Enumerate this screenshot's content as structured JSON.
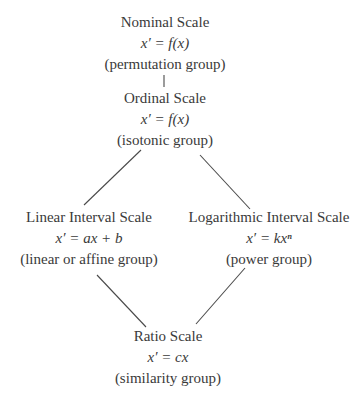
{
  "diagram": {
    "nodes": [
      {
        "id": "nominal",
        "title": "Nominal Scale",
        "formula": "x′ = f(x)",
        "group": "(permutation group)"
      },
      {
        "id": "ordinal",
        "title": "Ordinal Scale",
        "formula": "x′ = f(x)",
        "group": "(isotonic group)"
      },
      {
        "id": "linear",
        "title": "Linear Interval Scale",
        "formula": "x′ = ax + b",
        "group": "(linear or affine group)"
      },
      {
        "id": "logarithmic",
        "title": "Logarithmic Interval Scale",
        "formula": "x′ = kxⁿ",
        "group": "(power group)"
      },
      {
        "id": "ratio",
        "title": "Ratio Scale",
        "formula": "x′ = cx",
        "group": "(similarity group)"
      }
    ],
    "edges": [
      {
        "from": "nominal",
        "to": "ordinal"
      },
      {
        "from": "ordinal",
        "to": "linear"
      },
      {
        "from": "ordinal",
        "to": "logarithmic"
      },
      {
        "from": "linear",
        "to": "ratio"
      },
      {
        "from": "logarithmic",
        "to": "ratio"
      }
    ]
  }
}
